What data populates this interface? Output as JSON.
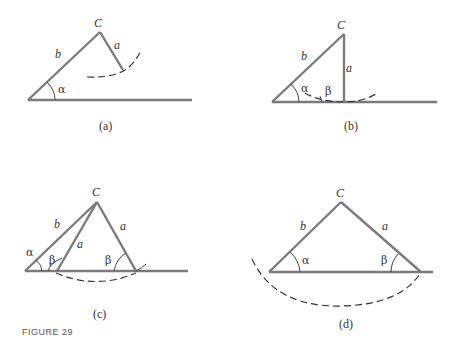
{
  "figure": {
    "caption": "FIGURE 29",
    "panels": [
      {
        "id": "a",
        "label": "(a)",
        "vertex": "C",
        "sides": [
          "b",
          "a"
        ],
        "angles": [
          "α"
        ]
      },
      {
        "id": "b",
        "label": "(b)",
        "vertex": "C",
        "sides": [
          "b",
          "a"
        ],
        "angles": [
          "α",
          "β"
        ]
      },
      {
        "id": "c",
        "label": "(c)",
        "vertex": "C",
        "sides": [
          "b",
          "a",
          "a"
        ],
        "angles": [
          "α",
          "β",
          "β"
        ]
      },
      {
        "id": "d",
        "label": "(d)",
        "vertex": "C",
        "sides": [
          "b",
          "a"
        ],
        "angles": [
          "α",
          "β"
        ]
      }
    ]
  }
}
